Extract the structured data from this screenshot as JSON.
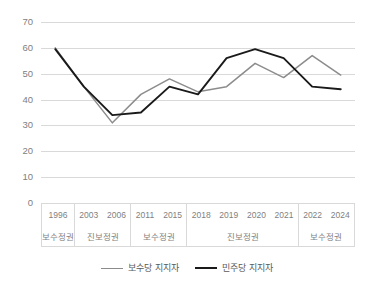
{
  "chart_data": {
    "type": "line",
    "title": "",
    "xlabel": "",
    "ylabel": "",
    "ylim": [
      0,
      70
    ],
    "yticks": [
      "0",
      "10",
      "20",
      "30",
      "40",
      "50",
      "60",
      "70"
    ],
    "grid": true,
    "legend_position": "bottom",
    "categories": [
      "1996",
      "2003",
      "2006",
      "2011",
      "2015",
      "2018",
      "2019",
      "2020",
      "2021",
      "2022",
      "2024"
    ],
    "groups": [
      {
        "label": "보수정권",
        "years": [
          "1996"
        ]
      },
      {
        "label": "진보정권",
        "years": [
          "2003",
          "2006"
        ]
      },
      {
        "label": "보수정권",
        "years": [
          "2011",
          "2015"
        ]
      },
      {
        "label": "진보정권",
        "years": [
          "2018",
          "2019",
          "2020",
          "2021"
        ]
      },
      {
        "label": "보수정권",
        "years": [
          "2022",
          "2024"
        ]
      }
    ],
    "series": [
      {
        "name": "보수당 지지자",
        "color": "#8c8c8c",
        "values": [
          60,
          45,
          31,
          42,
          48,
          43,
          45,
          54,
          48.5,
          57,
          49.5
        ]
      },
      {
        "name": "민주당 지지자",
        "color": "#1a1a1a",
        "values": [
          59.5,
          45,
          34,
          35,
          45,
          42,
          56,
          59.5,
          56,
          45,
          44
        ]
      }
    ]
  },
  "colors": {
    "gridline": "#d9d9d9",
    "axis_text": "#7f7f7f",
    "background": "#ffffff"
  }
}
